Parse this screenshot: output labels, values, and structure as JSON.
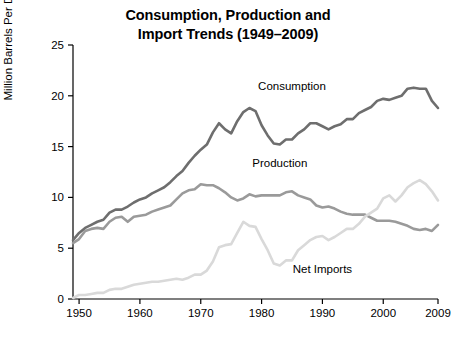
{
  "chart_data": {
    "type": "line",
    "title_lines": [
      "Consumption, Production and",
      "Import Trends (1949–2009)"
    ],
    "title": "Consumption, Production and Import Trends (1949–2009)",
    "xlabel": "",
    "ylabel": "Million Barrels Per Day",
    "xlim": [
      1949,
      2009
    ],
    "ylim": [
      0,
      25
    ],
    "xticks": [
      1950,
      1960,
      1970,
      1980,
      1990,
      2000,
      2009
    ],
    "yticks": [
      0,
      5,
      10,
      15,
      20,
      25
    ],
    "grid": false,
    "legend_position": "inline-annotations",
    "series": [
      {
        "name": "Consumption",
        "color": "#6e6e6e",
        "label_x": 1985,
        "label_y": 20.6,
        "x": [
          1949,
          1950,
          1951,
          1952,
          1953,
          1954,
          1955,
          1956,
          1957,
          1958,
          1959,
          1960,
          1961,
          1962,
          1963,
          1964,
          1965,
          1966,
          1967,
          1968,
          1969,
          1970,
          1971,
          1972,
          1973,
          1974,
          1975,
          1976,
          1977,
          1978,
          1979,
          1980,
          1981,
          1982,
          1983,
          1984,
          1985,
          1986,
          1987,
          1988,
          1989,
          1990,
          1991,
          1992,
          1993,
          1994,
          1995,
          1996,
          1997,
          1998,
          1999,
          2000,
          2001,
          2002,
          2003,
          2004,
          2005,
          2006,
          2007,
          2008,
          2009
        ],
        "y": [
          5.8,
          6.5,
          7.0,
          7.3,
          7.6,
          7.8,
          8.5,
          8.8,
          8.8,
          9.1,
          9.5,
          9.8,
          10.0,
          10.4,
          10.7,
          11.0,
          11.5,
          12.1,
          12.6,
          13.4,
          14.1,
          14.7,
          15.2,
          16.4,
          17.3,
          16.7,
          16.3,
          17.5,
          18.4,
          18.8,
          18.5,
          17.1,
          16.1,
          15.3,
          15.2,
          15.7,
          15.7,
          16.3,
          16.7,
          17.3,
          17.3,
          17.0,
          16.7,
          17.0,
          17.2,
          17.7,
          17.7,
          18.3,
          18.6,
          18.9,
          19.5,
          19.7,
          19.6,
          19.8,
          20.0,
          20.7,
          20.8,
          20.7,
          20.7,
          19.5,
          18.8
        ]
      },
      {
        "name": "Production",
        "color": "#9a9a9a",
        "label_x": 1983,
        "label_y": 13.0,
        "x": [
          1949,
          1950,
          1951,
          1952,
          1953,
          1954,
          1955,
          1956,
          1957,
          1958,
          1959,
          1960,
          1961,
          1962,
          1963,
          1964,
          1965,
          1966,
          1967,
          1968,
          1969,
          1970,
          1971,
          1972,
          1973,
          1974,
          1975,
          1976,
          1977,
          1978,
          1979,
          1980,
          1981,
          1982,
          1983,
          1984,
          1985,
          1986,
          1987,
          1988,
          1989,
          1990,
          1991,
          1992,
          1993,
          1994,
          1995,
          1996,
          1997,
          1998,
          1999,
          2000,
          2001,
          2002,
          2003,
          2004,
          2005,
          2006,
          2007,
          2008,
          2009
        ],
        "y": [
          5.5,
          5.9,
          6.7,
          6.9,
          7.0,
          6.9,
          7.6,
          8.0,
          8.1,
          7.6,
          8.1,
          8.2,
          8.3,
          8.6,
          8.8,
          9.0,
          9.2,
          9.8,
          10.4,
          10.7,
          10.8,
          11.3,
          11.2,
          11.2,
          10.9,
          10.5,
          10.0,
          9.7,
          9.9,
          10.3,
          10.1,
          10.2,
          10.2,
          10.2,
          10.2,
          10.5,
          10.6,
          10.2,
          10.0,
          9.8,
          9.2,
          9.0,
          9.1,
          8.9,
          8.6,
          8.4,
          8.3,
          8.3,
          8.3,
          8.0,
          7.7,
          7.7,
          7.7,
          7.6,
          7.4,
          7.2,
          6.9,
          6.8,
          6.9,
          6.7,
          7.3
        ]
      },
      {
        "name": "Net Imports",
        "color": "#d9d9d9",
        "label_x": 1990,
        "label_y": 2.6,
        "x": [
          1949,
          1950,
          1951,
          1952,
          1953,
          1954,
          1955,
          1956,
          1957,
          1958,
          1959,
          1960,
          1961,
          1962,
          1963,
          1964,
          1965,
          1966,
          1967,
          1968,
          1969,
          1970,
          1971,
          1972,
          1973,
          1974,
          1975,
          1976,
          1977,
          1978,
          1979,
          1980,
          1981,
          1982,
          1983,
          1984,
          1985,
          1986,
          1987,
          1988,
          1989,
          1990,
          1991,
          1992,
          1993,
          1994,
          1995,
          1996,
          1997,
          1998,
          1999,
          2000,
          2001,
          2002,
          2003,
          2004,
          2005,
          2006,
          2007,
          2008,
          2009
        ],
        "y": [
          0.1,
          0.4,
          0.4,
          0.5,
          0.6,
          0.6,
          0.9,
          1.0,
          1.0,
          1.2,
          1.4,
          1.5,
          1.6,
          1.7,
          1.7,
          1.8,
          1.9,
          2.0,
          1.9,
          2.1,
          2.4,
          2.4,
          2.8,
          3.7,
          5.1,
          5.3,
          5.4,
          6.5,
          7.6,
          7.2,
          7.1,
          5.9,
          4.8,
          3.5,
          3.3,
          3.8,
          3.8,
          4.8,
          5.3,
          5.8,
          6.1,
          6.2,
          5.8,
          6.1,
          6.5,
          6.9,
          6.9,
          7.4,
          8.1,
          8.5,
          8.9,
          9.9,
          10.2,
          9.6,
          10.2,
          11.0,
          11.4,
          11.7,
          11.3,
          10.6,
          9.7
        ]
      }
    ]
  }
}
